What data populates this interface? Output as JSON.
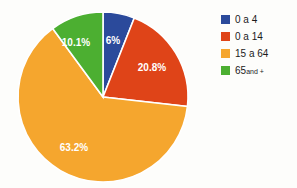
{
  "chart_data": {
    "type": "pie",
    "title": "",
    "subtitle": "",
    "xlabel": "",
    "ylabel": "",
    "grid": false,
    "legend_position": "right",
    "start_angle_deg": 0,
    "direction": "clockwise",
    "categories": [
      "0 a 4",
      "0 a 14",
      "15 a 64",
      "65 and +"
    ],
    "values": [
      6.0,
      20.8,
      63.2,
      10.1
    ],
    "data_labels": [
      "6%",
      "20.8%",
      "63.2%",
      "10.1%"
    ],
    "colors": [
      "#2b4a9b",
      "#df4418",
      "#f5a62e",
      "#4caf31"
    ],
    "slices": [
      {
        "name": "0 a 4",
        "value": 6.0,
        "label": "6%",
        "color": "#2b4a9b",
        "label_x": 113,
        "label_y": 41
      },
      {
        "name": "0 a 14",
        "value": 20.8,
        "label": "20.8%",
        "color": "#df4418",
        "label_x": 152,
        "label_y": 68
      },
      {
        "name": "15 a 64",
        "value": 63.2,
        "label": "63.2%",
        "color": "#f5a62e",
        "label_x": 74,
        "label_y": 148
      },
      {
        "name": "65 and +",
        "value": 10.1,
        "label": "10.1%",
        "color": "#4caf31",
        "label_x": 76,
        "label_y": 43
      }
    ]
  },
  "legend": {
    "items": [
      {
        "label": "0 a 4",
        "suffix": "",
        "color": "#2b4a9b"
      },
      {
        "label": "0 a 14",
        "suffix": "",
        "color": "#df4418"
      },
      {
        "label": "15 a 64",
        "suffix": "",
        "color": "#f5a62e"
      },
      {
        "label": "65",
        "suffix": "and +",
        "color": "#4caf31"
      }
    ]
  },
  "geometry": {
    "center_x": 103,
    "center_y": 97,
    "radius": 85
  },
  "style": {
    "background": "#fdfdfb",
    "separator": "#ffffff",
    "label_text": "#ffffff",
    "legend_text": "#1b1b1b"
  }
}
